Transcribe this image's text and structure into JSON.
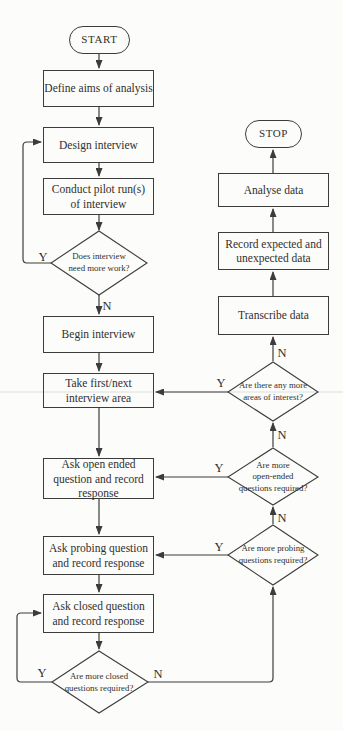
{
  "colors": {
    "background": "#fcfcfa",
    "line": "#3c3c3c",
    "text": "#30302e",
    "scan_artifact": "#e8e8e5"
  },
  "labels": {
    "yes": "Y",
    "no": "N"
  },
  "nodes": {
    "start": {
      "label": "START"
    },
    "define_aims": {
      "label": "Define aims of analysis"
    },
    "design_interview": {
      "label": "Design interview"
    },
    "conduct_pilot": {
      "label": "Conduct pilot run(s)\nof interview"
    },
    "does_need_work": {
      "label": "Does interview\nneed more work?"
    },
    "begin_interview": {
      "label": "Begin interview"
    },
    "take_area": {
      "label": "Take first/next\ninterview area"
    },
    "ask_open": {
      "label": "Ask open ended\nquestion and record\nresponse"
    },
    "ask_probing": {
      "label": "Ask probing question\nand record response"
    },
    "ask_closed": {
      "label": "Ask closed question\nand record response"
    },
    "more_closed": {
      "label": "Are more closed\nquestions required?"
    },
    "more_probing": {
      "label": "Are more probing\nquestions required?"
    },
    "more_open": {
      "label": "Are more\nopen-ended\nquestions required?"
    },
    "more_areas": {
      "label": "Are there any more\nareas of interest?"
    },
    "transcribe": {
      "label": "Transcribe data"
    },
    "record_expected": {
      "label": "Record expected and\nunexpected data"
    },
    "analyse": {
      "label": "Analyse data"
    },
    "stop": {
      "label": "STOP"
    }
  }
}
